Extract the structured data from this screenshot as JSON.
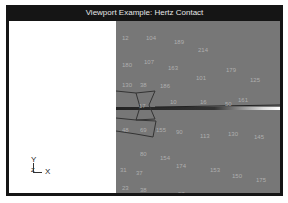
{
  "window": {
    "title": "Viewport Example: Hertz Contact"
  },
  "axes": {
    "y_label": "Y",
    "x_label": "X",
    "z_label": "Z"
  },
  "node_labels": [
    {
      "t": "12",
      "x": 122,
      "y": 8
    },
    {
      "t": "104",
      "x": 146,
      "y": 8
    },
    {
      "t": "189",
      "x": 174,
      "y": 12
    },
    {
      "t": "214",
      "x": 198,
      "y": 20
    },
    {
      "t": "179",
      "x": 226,
      "y": 40
    },
    {
      "t": "180",
      "x": 122,
      "y": 35
    },
    {
      "t": "107",
      "x": 144,
      "y": 32
    },
    {
      "t": "163",
      "x": 168,
      "y": 38
    },
    {
      "t": "101",
      "x": 196,
      "y": 48
    },
    {
      "t": "130",
      "x": 122,
      "y": 55
    },
    {
      "t": "38",
      "x": 140,
      "y": 55
    },
    {
      "t": "186",
      "x": 160,
      "y": 56
    },
    {
      "t": "125",
      "x": 250,
      "y": 50
    },
    {
      "t": "161",
      "x": 238,
      "y": 70
    },
    {
      "t": "17",
      "x": 139,
      "y": 76
    },
    {
      "t": "10",
      "x": 170,
      "y": 72
    },
    {
      "t": "16",
      "x": 200,
      "y": 72
    },
    {
      "t": "50",
      "x": 225,
      "y": 74
    },
    {
      "t": "48",
      "x": 122,
      "y": 100
    },
    {
      "t": "69",
      "x": 140,
      "y": 100
    },
    {
      "t": "155",
      "x": 156,
      "y": 100
    },
    {
      "t": "90",
      "x": 176,
      "y": 102
    },
    {
      "t": "113",
      "x": 200,
      "y": 106
    },
    {
      "t": "130",
      "x": 228,
      "y": 104
    },
    {
      "t": "145",
      "x": 254,
      "y": 107
    },
    {
      "t": "80",
      "x": 140,
      "y": 124
    },
    {
      "t": "154",
      "x": 160,
      "y": 128
    },
    {
      "t": "31",
      "x": 120,
      "y": 140
    },
    {
      "t": "37",
      "x": 136,
      "y": 143
    },
    {
      "t": "174",
      "x": 176,
      "y": 136
    },
    {
      "t": "153",
      "x": 210,
      "y": 140
    },
    {
      "t": "150",
      "x": 232,
      "y": 146
    },
    {
      "t": "23",
      "x": 122,
      "y": 158
    },
    {
      "t": "38",
      "x": 140,
      "y": 160
    },
    {
      "t": "175",
      "x": 256,
      "y": 150
    },
    {
      "t": "49",
      "x": 138,
      "y": 168
    },
    {
      "t": "97",
      "x": 178,
      "y": 164
    }
  ]
}
